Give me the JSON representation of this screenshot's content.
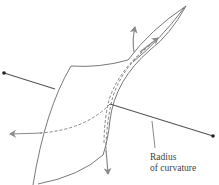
{
  "diagram": {
    "labels": {
      "radius_line1": "Radius",
      "radius_line2": "of curvature"
    },
    "colors": {
      "surface_outline": "#555555",
      "radius_line": "#555555",
      "tangent_arrows": "#8a8a8a",
      "dashed_curves": "#777777",
      "endpoint_dot": "#222222",
      "text": "#444444",
      "background": "#ffffff"
    },
    "elements": [
      {
        "name": "curved-surface",
        "type": "sheet"
      },
      {
        "name": "radius-line-left",
        "type": "line",
        "from_dot": [
          4,
          73
        ],
        "to": [
          55,
          89
        ]
      },
      {
        "name": "radius-line-right",
        "type": "line",
        "from_dot": [
          213,
          136
        ],
        "to": [
          110,
          104
        ]
      },
      {
        "name": "tangent-arrow-up",
        "type": "arrow",
        "direction": "up"
      },
      {
        "name": "tangent-arrow-down",
        "type": "arrow",
        "direction": "down"
      },
      {
        "name": "tangent-arrow-left",
        "type": "arrow",
        "direction": "left"
      },
      {
        "name": "tangent-arrow-upright",
        "type": "arrow",
        "direction": "up-right"
      }
    ]
  }
}
